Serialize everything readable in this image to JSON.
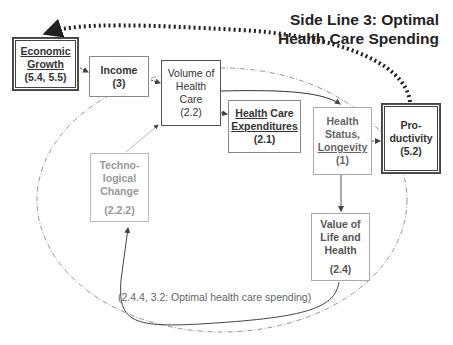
{
  "title": {
    "line1": "Side Line 3: Optimal",
    "line2": "Health Care Spending"
  },
  "nodes": {
    "economic_growth": {
      "line1": "Economic",
      "line2": "Growth",
      "ref": "(5.4, 5.5)"
    },
    "income": {
      "line1": "Income",
      "ref": "(3)"
    },
    "volume": {
      "line1": "Volume of",
      "line2": "Health",
      "line3": "Care",
      "ref": "(2.2)"
    },
    "expenditures": {
      "line1a": "Health",
      "line1b": " Care",
      "line2": "Expenditures",
      "ref": "(2.1)"
    },
    "health_status": {
      "line1": "Health",
      "line2": "Status,",
      "line3": "Longevity",
      "ref": "(1)"
    },
    "productivity": {
      "line1": "Pro-",
      "line2": "ductivity",
      "ref": "(5.2)"
    },
    "tech_change": {
      "line1": "Techno-",
      "line2": "logical",
      "line3": "Change",
      "ref": "(2.2.2)"
    },
    "value_life": {
      "line1": "Value of",
      "line2": "Life and",
      "line3": "Health",
      "ref": "(2.4)"
    }
  },
  "loop_note": "(2.4.4, 3.2: Optimal health care spending)",
  "colors": {
    "dark_line": "#333333",
    "dotted_arrow": "#222222",
    "dashdot": "#888888",
    "faded_text": "#999999"
  }
}
